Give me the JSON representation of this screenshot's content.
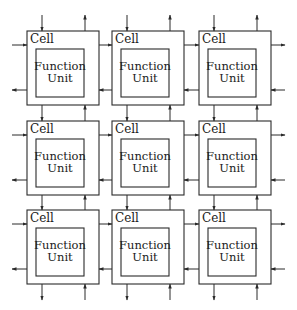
{
  "diagram": {
    "title": "",
    "grid": {
      "rows": 3,
      "cols": 3
    },
    "cell_label": "Cell",
    "unit_label_line1": "Function",
    "unit_label_line2": "Unit",
    "colors": {
      "stroke": "#2a2a2a",
      "text": "#1a1a1a",
      "background": "#ffffff"
    },
    "cells": [
      {
        "row": 0,
        "col": 0,
        "label": "Cell",
        "unit": [
          "Function",
          "Unit"
        ]
      },
      {
        "row": 0,
        "col": 1,
        "label": "Cell",
        "unit": [
          "Function",
          "Unit"
        ]
      },
      {
        "row": 0,
        "col": 2,
        "label": "Cell",
        "unit": [
          "Function",
          "Unit"
        ]
      },
      {
        "row": 1,
        "col": 0,
        "label": "Cell",
        "unit": [
          "Function",
          "Unit"
        ]
      },
      {
        "row": 1,
        "col": 1,
        "label": "Cell",
        "unit": [
          "Function",
          "Unit"
        ]
      },
      {
        "row": 1,
        "col": 2,
        "label": "Cell",
        "unit": [
          "Function",
          "Unit"
        ]
      },
      {
        "row": 2,
        "col": 0,
        "label": "Cell",
        "unit": [
          "Function",
          "Unit"
        ]
      },
      {
        "row": 2,
        "col": 1,
        "label": "Cell",
        "unit": [
          "Function",
          "Unit"
        ]
      },
      {
        "row": 2,
        "col": 2,
        "label": "Cell",
        "unit": [
          "Function",
          "Unit"
        ]
      }
    ],
    "connections": {
      "horizontal": "each row: top wire flows right (→), bottom wire flows left (←)",
      "vertical": "each column: left wire flows down (↓), right wire flows up (↑)"
    }
  }
}
